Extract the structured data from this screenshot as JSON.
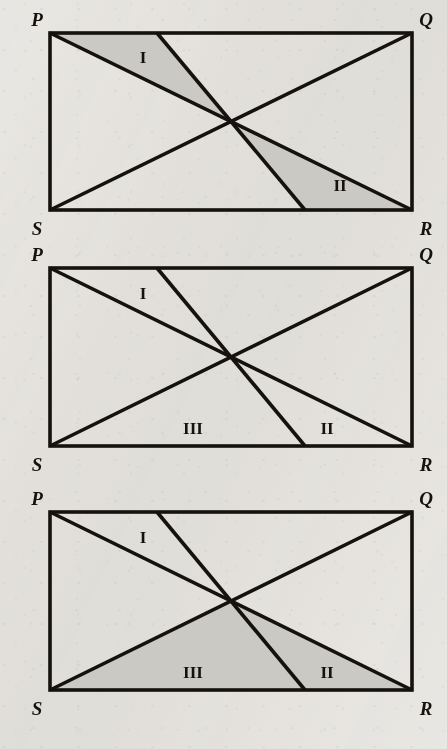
{
  "page": {
    "background_color": "#e9e7e3",
    "ink_color": "#14110e",
    "shade_color": "#cbc9c4",
    "width": 447,
    "height": 749
  },
  "geometry": {
    "rect": {
      "left": 50,
      "right": 412,
      "width": 362
    },
    "top_cevian_x": 157,
    "bottom_cevian_x": 305,
    "center_x": 231
  },
  "figures": [
    {
      "id": "figure-1",
      "top": 33,
      "bottom": 210,
      "vertices": {
        "P": "P",
        "Q": "Q",
        "R": "R",
        "S": "S"
      },
      "regions": [
        {
          "label": "I",
          "shaded": true,
          "x": 143,
          "y": 63
        },
        {
          "label": "II",
          "shaded": true,
          "x": 340,
          "y": 191
        }
      ]
    },
    {
      "id": "figure-2",
      "top": 268,
      "bottom": 446,
      "vertices": {
        "P": "P",
        "Q": "Q",
        "R": "R",
        "S": "S"
      },
      "regions": [
        {
          "label": "I",
          "shaded": false,
          "x": 143,
          "y": 299
        },
        {
          "label": "III",
          "shaded": false,
          "x": 193,
          "y": 434
        },
        {
          "label": "II",
          "shaded": false,
          "x": 327,
          "y": 434
        }
      ]
    },
    {
      "id": "figure-3",
      "top": 512,
      "bottom": 690,
      "vertices": {
        "P": "P",
        "Q": "Q",
        "R": "R",
        "S": "S"
      },
      "regions": [
        {
          "label": "I",
          "shaded": false,
          "x": 143,
          "y": 543
        },
        {
          "label": "III",
          "shaded": true,
          "x": 193,
          "y": 678
        },
        {
          "label": "II",
          "shaded": true,
          "x": 327,
          "y": 678
        }
      ]
    }
  ]
}
